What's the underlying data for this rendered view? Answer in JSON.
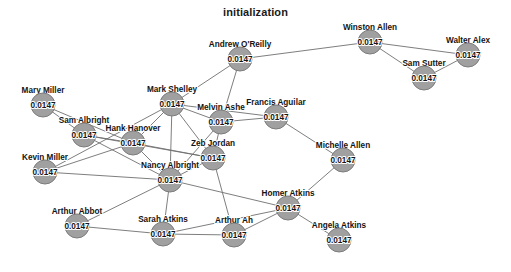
{
  "chart_data": {
    "type": "network",
    "title": "initialization",
    "value_label": "0.0147",
    "node_radius": 12,
    "node_fill": "#a0a0a0",
    "node_stroke": "#7c7c7c",
    "edge_color": "#6f6f6f",
    "background": "#ffffff",
    "xlim": [
      0,
      511
    ],
    "ylim": [
      0,
      272
    ],
    "nodes": [
      {
        "id": "andrew_oreilly",
        "label": "Andrew O'Reilly",
        "value": "0.0147",
        "x": 240,
        "y": 59,
        "label_dx": 0,
        "label_dy": -12
      },
      {
        "id": "winston_allen",
        "label": "Winston Allen",
        "value": "0.0147",
        "x": 370,
        "y": 42,
        "label_dx": 0,
        "label_dy": -12
      },
      {
        "id": "walter_alex",
        "label": "Walter Alex",
        "value": "0.0147",
        "x": 468,
        "y": 55,
        "label_dx": 0,
        "label_dy": -12
      },
      {
        "id": "sam_sutter",
        "label": "Sam Sutter",
        "value": "0.0147",
        "x": 424,
        "y": 78,
        "label_dx": 0,
        "label_dy": -12
      },
      {
        "id": "mark_shelley",
        "label": "Mark Shelley",
        "value": "0.0147",
        "x": 172,
        "y": 104,
        "label_dx": 0,
        "label_dy": -12
      },
      {
        "id": "mary_miller",
        "label": "Mary Miller",
        "value": "0.0147",
        "x": 43,
        "y": 105,
        "label_dx": 0,
        "label_dy": -12
      },
      {
        "id": "francis_aguilar",
        "label": "Francis Aguilar",
        "value": "0.0147",
        "x": 276,
        "y": 117,
        "label_dx": 0,
        "label_dy": -12
      },
      {
        "id": "melvin_ashe",
        "label": "Melvin Ashe",
        "value": "0.0147",
        "x": 221,
        "y": 122,
        "label_dx": 0,
        "label_dy": -12
      },
      {
        "id": "sam_albright",
        "label": "Sam Albright",
        "value": "0.0147",
        "x": 84,
        "y": 135,
        "label_dx": 0,
        "label_dy": -12
      },
      {
        "id": "hank_hanover",
        "label": "Hank Hanover",
        "value": "0.0147",
        "x": 133,
        "y": 143,
        "label_dx": 0,
        "label_dy": -12
      },
      {
        "id": "zeb_jordan",
        "label": "Zeb Jordan",
        "value": "0.0147",
        "x": 213,
        "y": 158,
        "label_dx": 0,
        "label_dy": -12
      },
      {
        "id": "michelle_allen",
        "label": "Michelle Allen",
        "value": "0.0147",
        "x": 343,
        "y": 160,
        "label_dx": 0,
        "label_dy": -12
      },
      {
        "id": "kevin_miller",
        "label": "Kevin Miller",
        "value": "0.0147",
        "x": 45,
        "y": 172,
        "label_dx": 0,
        "label_dy": -12
      },
      {
        "id": "nancy_albright",
        "label": "Nancy Albright",
        "value": "0.0147",
        "x": 170,
        "y": 180,
        "label_dx": 0,
        "label_dy": -12
      },
      {
        "id": "homer_atkins",
        "label": "Homer Atkins",
        "value": "0.0147",
        "x": 288,
        "y": 208,
        "label_dx": 0,
        "label_dy": -12
      },
      {
        "id": "arthur_abbot",
        "label": "Arthur Abbot",
        "value": "0.0147",
        "x": 77,
        "y": 226,
        "label_dx": 0,
        "label_dy": -12
      },
      {
        "id": "arthur_ah",
        "label": "Arthur Ah",
        "value": "0.0147",
        "x": 234,
        "y": 235,
        "label_dx": 0,
        "label_dy": -12
      },
      {
        "id": "sarah_atkins",
        "label": "Sarah Atkins",
        "value": "0.0147",
        "x": 163,
        "y": 234,
        "label_dx": 0,
        "label_dy": -12
      },
      {
        "id": "angela_atkins",
        "label": "Angela Atkins",
        "value": "0.0147",
        "x": 339,
        "y": 240,
        "label_dx": 0,
        "label_dy": -12
      }
    ],
    "edges": [
      [
        "andrew_oreilly",
        "winston_allen"
      ],
      [
        "andrew_oreilly",
        "mark_shelley"
      ],
      [
        "andrew_oreilly",
        "melvin_ashe"
      ],
      [
        "winston_allen",
        "walter_alex"
      ],
      [
        "winston_allen",
        "sam_sutter"
      ],
      [
        "walter_alex",
        "sam_sutter"
      ],
      [
        "mark_shelley",
        "melvin_ashe"
      ],
      [
        "mark_shelley",
        "hank_hanover"
      ],
      [
        "mark_shelley",
        "zeb_jordan"
      ],
      [
        "mark_shelley",
        "francis_aguilar"
      ],
      [
        "mark_shelley",
        "nancy_albright"
      ],
      [
        "mark_shelley",
        "kevin_miller"
      ],
      [
        "mary_miller",
        "hank_hanover"
      ],
      [
        "mary_miller",
        "sam_albright"
      ],
      [
        "francis_aguilar",
        "michelle_allen"
      ],
      [
        "francis_aguilar",
        "melvin_ashe"
      ],
      [
        "melvin_ashe",
        "zeb_jordan"
      ],
      [
        "melvin_ashe",
        "nancy_albright"
      ],
      [
        "sam_albright",
        "hank_hanover"
      ],
      [
        "sam_albright",
        "zeb_jordan"
      ],
      [
        "sam_albright",
        "nancy_albright"
      ],
      [
        "hank_hanover",
        "zeb_jordan"
      ],
      [
        "hank_hanover",
        "nancy_albright"
      ],
      [
        "hank_hanover",
        "kevin_miller"
      ],
      [
        "zeb_jordan",
        "nancy_albright"
      ],
      [
        "zeb_jordan",
        "arthur_ah"
      ],
      [
        "michelle_allen",
        "homer_atkins"
      ],
      [
        "kevin_miller",
        "nancy_albright"
      ],
      [
        "nancy_albright",
        "sarah_atkins"
      ],
      [
        "nancy_albright",
        "arthur_abbot"
      ],
      [
        "nancy_albright",
        "homer_atkins"
      ],
      [
        "homer_atkins",
        "arthur_ah"
      ],
      [
        "homer_atkins",
        "sarah_atkins"
      ],
      [
        "homer_atkins",
        "angela_atkins"
      ],
      [
        "arthur_abbot",
        "sarah_atkins"
      ],
      [
        "arthur_ah",
        "sarah_atkins"
      ]
    ]
  }
}
